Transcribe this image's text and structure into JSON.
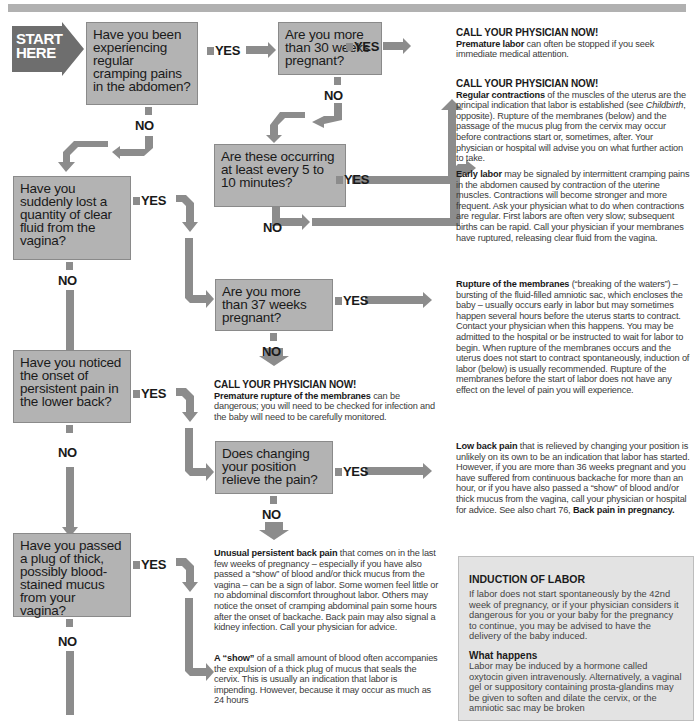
{
  "start": {
    "label_line1": "START",
    "label_line2": "HERE"
  },
  "labels": {
    "yes": "YES",
    "no": "NO"
  },
  "questions": [
    {
      "id": "q1",
      "text": "Have you been experiencing regular cramping pains in the abdomen?"
    },
    {
      "id": "q2",
      "text": "Are you more than 30 weeks pregnant?"
    },
    {
      "id": "q3",
      "text": "Are these occurring at least every 5 to 10 minutes?"
    },
    {
      "id": "q4",
      "text": "Have you suddenly lost a quantity of clear fluid from the vagina?"
    },
    {
      "id": "q5",
      "text": "Are you more than 37 weeks pregnant?"
    },
    {
      "id": "q6",
      "text": "Have you noticed the onset of persistent pain in the lower back?"
    },
    {
      "id": "q7",
      "text": "Does changing your position relieve the pain?"
    },
    {
      "id": "q8",
      "text": "Have you passed a plug of thick, possibly blood-stained mucus from your vagina?"
    }
  ],
  "outcomes": {
    "premature_labor": {
      "heading": "CALL YOUR PHYSICIAN NOW!",
      "bold": "Premature labor",
      "text": " can often be stopped if you seek immediate medical attention."
    },
    "regular_contractions": {
      "heading": "CALL YOUR PHYSICIAN NOW!",
      "bold": "Regular contractions",
      "text_a": " of the muscles of the uterus are the principal indication that labor is established (see ",
      "italic": "Childbirth",
      "text_b": ", opposite). Rupture of the membranes (below) and the passage of the mucus plug from the cervix may occur before contractions start or, sometimes, after. Your physician or hospital will advise you on what further action to take."
    },
    "early_labor": {
      "bold": "Early labor",
      "text": " may be signaled by intermittent cramping pains in the abdomen caused by contraction of the uterine muscles. Contractions will become stronger and more frequent. Ask your physician what to do when contractions are regular. First labors are often very slow; subsequent births can be rapid. Call your physician if your membranes have ruptured, releasing clear fluid from the vagina."
    },
    "rupture": {
      "bold": "Rupture of the membranes",
      "text": " (“breaking of the waters”) – bursting of the fluid-filled amniotic sac, which encloses the baby – usually occurs early in labor but may sometimes happen several hours before the uterus starts to contract. Contact your physician when this happens. You may be admitted to the hospital or be instructed to wait for labor to begin. When rupture of the membranes occurs and the uterus does not start to contract spontaneously, induction of labor (below) is usually recommended. Rupture of the membranes before the start of labor does not have any effect on the level of pain you will experience."
    },
    "premature_rupture": {
      "heading": "CALL YOUR PHYSICIAN NOW!",
      "bold": "Premature rupture of the membranes",
      "text": " can be dangerous; you will need to be checked for infection and the baby will need to be carefully monitored."
    },
    "low_back_pain": {
      "bold": "Low back pain",
      "text": " that is relieved by changing your position is unlikely on its own to be an indication that labor has started. However, if you are more than 36 weeks pregnant and you have suffered from continuous backache for more than an hour, or if you have also passed a “show” of blood and/or thick mucus from the vagina, call your physician or hospital for advice. See also chart 76, ",
      "bold_end": "Back pain in pregnancy."
    },
    "unusual_back_pain": {
      "bold": "Unusual persistent back pain",
      "text": " that comes on in the last few weeks of pregnancy – especially if you have also passed a “show” of blood and/or thick mucus from the vagina – can be a sign of labor. Some women feel little or no abdominal discomfort throughout labor. Others may notice the onset of cramping abdominal pain some hours after the onset of backache. Back pain may also signal a kidney infection. Call your physician for advice."
    },
    "show": {
      "bold": "A “show”",
      "text": " of a small amount of blood often accompanies the expulsion of a thick plug of mucus that seals the cervix. This is usually an indication that labor is impending. However, because it may occur as much as 24 hours"
    }
  },
  "induction": {
    "title": "INDUCTION OF LABOR",
    "body": "If labor does not start spontaneously by the 42nd week of pregnancy, or if your physician considers it dangerous for you or your baby for the pregnancy to continue, you may be advised to have the delivery of the baby induced.",
    "subtitle": "What happens",
    "body2": "Labor may be induced by a hormone called oxytocin given intravenously. Alternatively, a vaginal gel or suppository containing prosta-glandins may be given to soften and dilate the cervix, or the amniotic sac may be broken"
  },
  "colors": {
    "box_fill": "#b3b3b3",
    "arrow_fill": "#8c8c8c",
    "start_fill": "#6e6e6e",
    "induction_fill": "#e3e3e3"
  }
}
